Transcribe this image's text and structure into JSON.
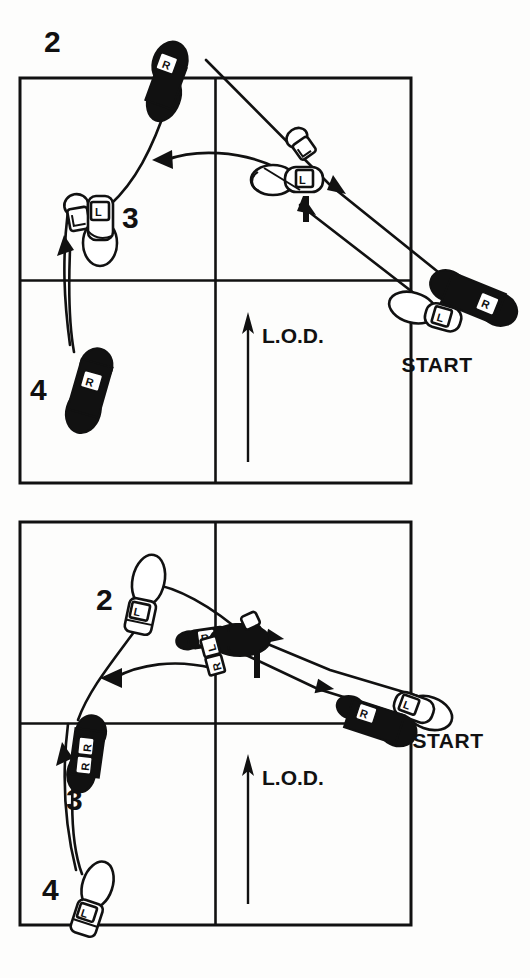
{
  "figure": {
    "kind": "dance-step-diagram",
    "ink_color": "#111111",
    "paper_color": "#fdfdfc"
  },
  "diagrams": [
    {
      "id": "top",
      "name": "upper-step-diagram",
      "box": {
        "x": 20,
        "y": 78,
        "width": 391,
        "height": 405,
        "has_center_cross": true
      },
      "lod": {
        "label": "L.O.D.",
        "direction": "up"
      },
      "start": {
        "label": "START",
        "feet": [
          {
            "foot": "R",
            "style": "filled"
          },
          {
            "foot": "L",
            "style": "outline"
          }
        ]
      },
      "steps": [
        {
          "number": "1",
          "foot": "L",
          "style": "outline",
          "note": "two overlapping outline footprints near center-top-right"
        },
        {
          "number": "2",
          "foot": "R",
          "style": "filled",
          "note": "upper left, outside top edge of box"
        },
        {
          "number": "3",
          "foot": "L",
          "style": "outline",
          "note": "left side, overlapping outline footprints"
        },
        {
          "number": "4",
          "foot": "R",
          "style": "filled",
          "note": "lower left quadrant"
        }
      ]
    },
    {
      "id": "bottom",
      "name": "lower-step-diagram",
      "box": {
        "x": 20,
        "y": 30,
        "width": 391,
        "height": 403,
        "has_center_cross": true
      },
      "lod": {
        "label": "L.O.D.",
        "direction": "up"
      },
      "start": {
        "label": "START",
        "feet": [
          {
            "foot": "R",
            "style": "filled"
          },
          {
            "foot": "L",
            "style": "outline"
          }
        ]
      },
      "steps": [
        {
          "number": "1",
          "foot": "R",
          "style": "filled",
          "note": "center, filled footprints with R labels"
        },
        {
          "number": "2",
          "foot": "L",
          "style": "outline",
          "note": "upper left, outline footprint"
        },
        {
          "number": "3",
          "foot": "R",
          "style": "filled",
          "note": "left middle, filled footprints"
        },
        {
          "number": "4",
          "foot": "L",
          "style": "outline",
          "note": "lower left, outline footprint"
        }
      ]
    }
  ],
  "labels": {
    "top": {
      "step1": "1",
      "step2": "2",
      "step3": "3",
      "step4": "4",
      "start": "START",
      "lod": "L.O.D.",
      "foot_start_r": "R",
      "foot_start_l": "L",
      "foot_1_l": "L",
      "foot_2_r": "R",
      "foot_3_l": "L",
      "foot_3_l2": "L",
      "foot_4_r": "R"
    },
    "bottom": {
      "step1": "1",
      "step2": "2",
      "step3": "3",
      "step4": "4",
      "start": "START",
      "lod": "L.O.D.",
      "foot_start_r": "R",
      "foot_start_l": "L",
      "foot_1_r": "R",
      "foot_1_r2": "R",
      "foot_1_l": "L",
      "foot_2_l": "L",
      "foot_3_r": "R",
      "foot_3_r2": "R",
      "foot_4_l": "L"
    }
  }
}
